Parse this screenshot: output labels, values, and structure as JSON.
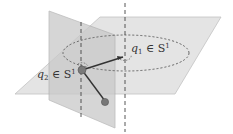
{
  "diagram": {
    "type": "double-pendulum-configuration",
    "labels": {
      "q1": {
        "var": "q",
        "sub": "1",
        "rel": " ∈ S",
        "sup": "1"
      },
      "q2": {
        "var": "q",
        "sub": "2",
        "rel": " ∈ S",
        "sup": "1"
      }
    },
    "colors": {
      "horizontal_plane": "#d9d9d9",
      "vertical_plane": "#c4c4c4",
      "lines": "#333333",
      "dashed": "#444444",
      "ball": "#777777"
    }
  }
}
